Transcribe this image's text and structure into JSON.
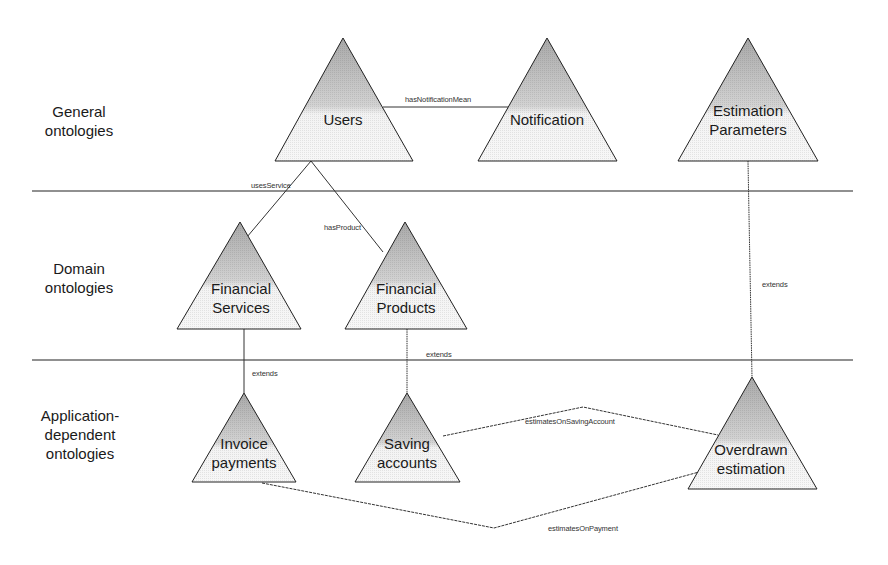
{
  "layers": [
    {
      "id": "general",
      "label": "General\nontologies"
    },
    {
      "id": "domain",
      "label": "Domain\nontologies"
    },
    {
      "id": "application",
      "label": "Application-\ndependent\nontologies"
    }
  ],
  "nodes": {
    "users": {
      "label": "Users"
    },
    "notification": {
      "label": "Notification"
    },
    "estimation_parameters": {
      "label": "Estimation\nParameters"
    },
    "financial_services": {
      "label": "Financial\nServices"
    },
    "financial_products": {
      "label": "Financial\nProducts"
    },
    "invoice_payments": {
      "label": "Invoice\npayments"
    },
    "saving_accounts": {
      "label": "Saving\naccounts"
    },
    "overdrawn_estimation": {
      "label": "Overdrawn\nestimation"
    }
  },
  "relations": {
    "has_notification_mean": {
      "label": "hasNotificationMean",
      "from": "Users",
      "to": "Notification"
    },
    "uses_service": {
      "label": "usesService",
      "from": "Users",
      "to": "Financial Services"
    },
    "has_product": {
      "label": "hasProduct",
      "from": "Users",
      "to": "Financial Products"
    },
    "extends_services": {
      "label": "extends",
      "from": "Invoice payments",
      "to": "Financial Services"
    },
    "extends_products": {
      "label": "extends",
      "from": "Saving accounts",
      "to": "Financial Products"
    },
    "extends_parameters": {
      "label": "extends",
      "from": "Overdrawn estimation",
      "to": "Estimation Parameters"
    },
    "estimates_on_saving_account": {
      "label": "estimatesOnSavingAccount",
      "from": "Overdrawn estimation",
      "to": "Saving accounts"
    },
    "estimates_on_payment": {
      "label": "estimatesOnPayment",
      "from": "Overdrawn estimation",
      "to": "Invoice payments"
    }
  },
  "colors": {
    "line": "#222222",
    "triangle_fill_top": "#b8b8b8",
    "triangle_fill_bottom": "#f4f4f4",
    "text": "#1a1a1a"
  }
}
